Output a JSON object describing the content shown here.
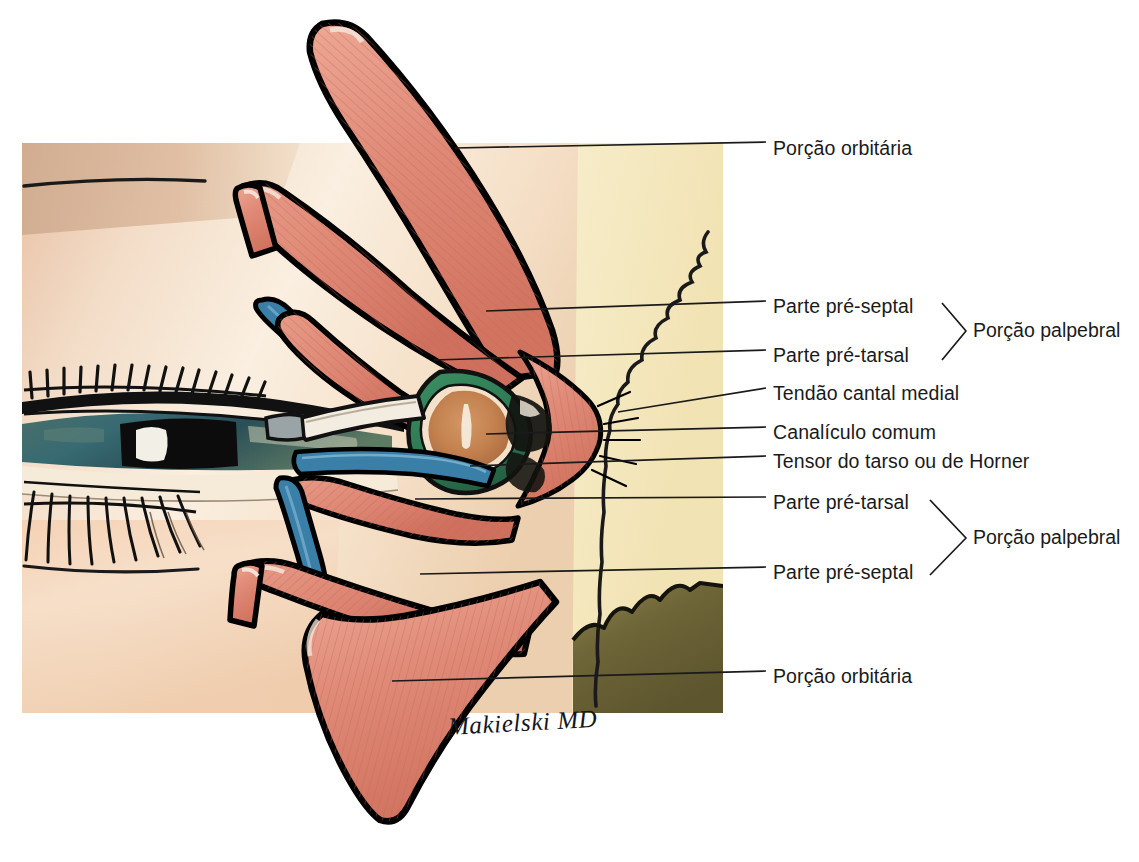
{
  "figure": {
    "signature": "Makielski MD",
    "panel": {
      "x": 22,
      "y": 143,
      "width": 701,
      "height": 570
    }
  },
  "palette": {
    "muscle_fill": "#e08a78",
    "muscle_fill_light": "#eda894",
    "muscle_stripe": "#c4705f",
    "muscle_outline": "#000000",
    "tarsus_blue": "#3a7fa8",
    "sac_green": "#2f7d56",
    "sac_interior": "#c3814f",
    "background_tan": "#f0e0b0",
    "background_skin": "#f7e7d4",
    "shadow_olive": "#6e6439",
    "leader_line": "#1a1a1a",
    "text": "#1a1a1a",
    "page_background": "#ffffff"
  },
  "labels": [
    {
      "id": "porcao-orbitaria-superior",
      "text": "Porção orbitária",
      "text_x": 773,
      "text_y": 149,
      "leader": {
        "x1": 455,
        "y1": 148,
        "x2": 766,
        "y2": 142
      }
    },
    {
      "id": "parte-pre-septal-superior",
      "text": "Parte pré-septal",
      "text_x": 773,
      "text_y": 307,
      "leader": {
        "x1": 486,
        "y1": 311,
        "x2": 766,
        "y2": 301
      }
    },
    {
      "id": "parte-pre-tarsal-superior",
      "text": "Parte pré-tarsal",
      "text_x": 773,
      "text_y": 356,
      "leader": {
        "x1": 434,
        "y1": 360,
        "x2": 766,
        "y2": 350
      }
    },
    {
      "id": "tendao-cantal-medial",
      "text": "Tendão cantal medial",
      "text_x": 773,
      "text_y": 394,
      "leader": {
        "x1": 618,
        "y1": 412,
        "x2": 766,
        "y2": 388
      }
    },
    {
      "id": "canaliculo-comum",
      "text": "Canalículo comum",
      "text_x": 773,
      "text_y": 433,
      "leader": {
        "x1": 486,
        "y1": 434,
        "x2": 766,
        "y2": 427
      }
    },
    {
      "id": "tensor-do-tarso",
      "text": "Tensor do tarso ou de Horner",
      "text_x": 773,
      "text_y": 462,
      "leader": {
        "x1": 470,
        "y1": 466,
        "x2": 766,
        "y2": 456
      }
    },
    {
      "id": "parte-pre-tarsal-inferior",
      "text": "Parte pré-tarsal",
      "text_x": 773,
      "text_y": 503,
      "leader": {
        "x1": 415,
        "y1": 499,
        "x2": 766,
        "y2": 497
      }
    },
    {
      "id": "parte-pre-septal-inferior",
      "text": "Parte pré-septal",
      "text_x": 773,
      "text_y": 573,
      "leader": {
        "x1": 420,
        "y1": 574,
        "x2": 766,
        "y2": 567
      }
    },
    {
      "id": "porcao-orbitaria-inferior",
      "text": "Porção orbitária",
      "text_x": 773,
      "text_y": 677,
      "leader": {
        "x1": 392,
        "y1": 681,
        "x2": 766,
        "y2": 671
      }
    }
  ],
  "groups": [
    {
      "id": "porcao-palpebral-superior",
      "text": "Porção palpebral",
      "text_x": 973,
      "text_y": 331,
      "brace": {
        "top_x": 942,
        "top_y": 303,
        "apex_x": 966,
        "apex_y": 331,
        "bottom_x": 942,
        "bottom_y": 360
      }
    },
    {
      "id": "porcao-palpebral-inferior",
      "text": "Porção palpebral",
      "text_x": 973,
      "text_y": 538,
      "brace": {
        "top_x": 930,
        "top_y": 500,
        "apex_x": 966,
        "apex_y": 538,
        "bottom_x": 930,
        "bottom_y": 575
      }
    }
  ]
}
